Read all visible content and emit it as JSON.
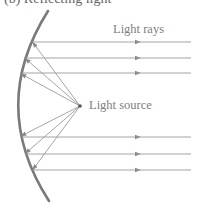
{
  "caption": "(b) Reflecting light",
  "labels": {
    "light_rays": "Light rays",
    "light_source": "Light source"
  },
  "colors": {
    "mirror": "#7a7a7a",
    "ray": "#9a9a9a",
    "text": "#808080"
  },
  "geometry": {
    "mirror": {
      "top": [
        48,
        11
      ],
      "apex": [
        18,
        106
      ],
      "bottom": [
        49,
        201
      ]
    },
    "source": [
      80,
      106
    ],
    "parallel_rays_y": [
      42,
      58,
      73,
      137,
      154,
      170
    ],
    "reflection_x": [
      33,
      26,
      22,
      22,
      26,
      33
    ],
    "ray_end_x": 191,
    "arrow_x": 136
  }
}
